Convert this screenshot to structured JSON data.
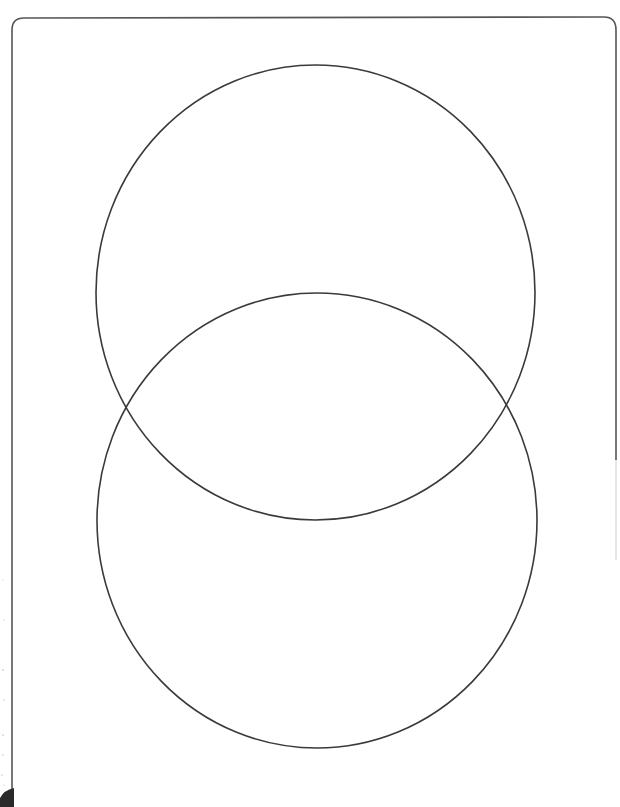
{
  "diagram": {
    "type": "venn",
    "title": "",
    "sets": [
      {
        "id": "top-circle",
        "label": "",
        "cx": 315.5,
        "cy": 292.5,
        "rx": 219.5,
        "ry": 227.5
      },
      {
        "id": "bottom-circle",
        "label": "",
        "cx": 317,
        "cy": 520.5,
        "rx": 220,
        "ry": 227.5
      }
    ],
    "frame": {
      "x": 12,
      "y": 17,
      "right": 617,
      "corner_radius": 12
    },
    "colors": {
      "background": "#ffffff",
      "circle_stroke": "#3a3a3a",
      "frame_stroke": "#555555",
      "corner_blob": "#2a2a2a"
    }
  }
}
